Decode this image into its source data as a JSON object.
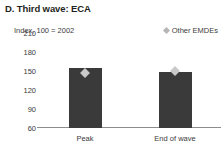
{
  "chart_data": {
    "type": "bar",
    "title": "D. Third wave: ECA",
    "ylabel": "Index, 100 = 2002",
    "xlabel": "",
    "categories": [
      "Peak",
      "End of wave"
    ],
    "values": [
      155,
      148
    ],
    "yticks": [
      210,
      180,
      150,
      120,
      90,
      60
    ],
    "ylim": [
      60,
      210
    ],
    "grid": false,
    "legend": {
      "position": "top-right",
      "entries": [
        {
          "label": "Other EMDEs",
          "marker": "diamond",
          "color": "#b6b6b6"
        }
      ]
    },
    "series": [
      {
        "name": "ECA",
        "type": "bar",
        "color": "#3a3a3a",
        "values": [
          155,
          148
        ]
      },
      {
        "name": "Other EMDEs",
        "type": "scatter",
        "marker": "diamond",
        "color": "#c9c9c9",
        "values": [
          147,
          150
        ]
      }
    ]
  },
  "colors": {
    "bar": "#3a3a3a",
    "marker": "#c9c9c9",
    "legend_marker": "#b6b6b6",
    "axis": "#8c8c8c",
    "text": "#231f20"
  }
}
